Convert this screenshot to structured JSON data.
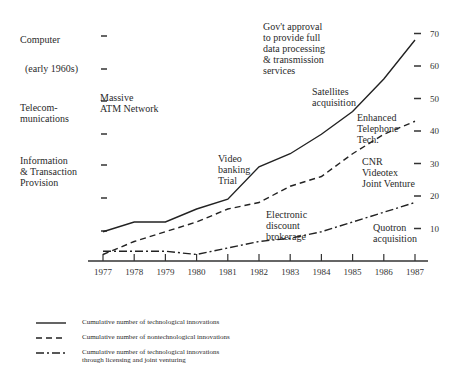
{
  "chart_data": {
    "type": "line",
    "title": "",
    "xlabel": "",
    "ylabel": "",
    "x": [
      1977,
      1978,
      1979,
      1980,
      1981,
      1982,
      1983,
      1984,
      1985,
      1986,
      1987
    ],
    "x_tick_labels": [
      "1977",
      "1978",
      "1979",
      "1980",
      "1981",
      "1982",
      "1983",
      "1984",
      "1985",
      "1986",
      "1987"
    ],
    "y_tick_labels": [
      "10",
      "20",
      "30",
      "40",
      "50",
      "60",
      "70"
    ],
    "ylim": [
      0,
      72
    ],
    "grid": false,
    "legend_position": "bottom",
    "series": [
      {
        "name": "Cumulative number of technological innovations",
        "style": "solid",
        "values": [
          9,
          12,
          12,
          16,
          19,
          29,
          33,
          39,
          46,
          56,
          68
        ]
      },
      {
        "name": "Cumulative number of nontechnological innovations",
        "style": "dashed",
        "values": [
          2,
          6,
          9,
          12,
          16,
          18,
          23,
          26,
          33,
          39,
          43
        ]
      },
      {
        "name": "Cumulative number of technological innovations through licensing and joint venturing",
        "style": "dash-dot",
        "values": [
          3,
          3,
          3,
          2,
          4,
          6,
          7,
          9,
          12,
          15,
          18
        ]
      }
    ],
    "left_axis_categories": [
      {
        "label": "Computer",
        "sub": "(early 1960s)"
      },
      {
        "label": "Telecom-\nmunications"
      },
      {
        "label": "Information\n& Transaction\nProvision"
      }
    ],
    "annotations": [
      "Gov't approval\nto provide full\ndata processing\n& transmission\nservices",
      "Massive\nATM Network",
      "Satellites\nacquisition",
      "Enhanced\nTelephone\nTech.",
      "Video\nbanking\nTrial",
      "CNR\nVideotex\nJoint Venture",
      "Electronic\ndiscount\nbrokerage",
      "Quotron\nacquisition"
    ]
  },
  "categories": {
    "computer": "Computer",
    "computer_sub": "(early 1960s)",
    "telecom": "Telecom-\nmunications",
    "info": "Information\n& Transaction\nProvision"
  },
  "annotations": {
    "gov": "Gov't approval\nto provide full\ndata processing\n& transmission\nservices",
    "atm": "Massive\nATM Network",
    "satellites": "Satellites\nacquisition",
    "enhanced": "Enhanced\nTelephone\nTech.",
    "video": "Video\nbanking\nTrial",
    "cnr": "CNR\nVideotex\nJoint Venture",
    "electronic": "Electronic\ndiscount\nbrokerage",
    "quotron": "Quotron\nacquisition"
  },
  "legend": {
    "solid": "Cumulative number of technological innovations",
    "dashed": "Cumulative number of nontechnological innovations",
    "dashdot": "Cumulative number of technological innovations\nthrough licensing and joint venturing"
  }
}
